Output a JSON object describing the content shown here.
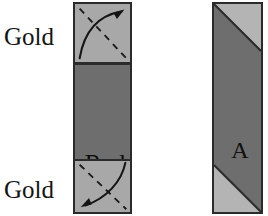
{
  "canvas": {
    "width": 268,
    "height": 216,
    "background": "#ffffff"
  },
  "figure": {
    "title": ""
  },
  "labels": {
    "gold_top": "Gold",
    "gold_bottom": "Gold",
    "red": "Red",
    "a": "A"
  },
  "left_strip": {
    "name": "layered-strip",
    "segments": [
      {
        "id": "gold-top",
        "label": "Gold",
        "fill": "#a8a8a8",
        "annotation": "curved-arrow-up-right-with-dashed-diagonal"
      },
      {
        "id": "red-middle",
        "label": "Red",
        "fill": "#6e6e6e",
        "annotation": "none"
      },
      {
        "id": "gold-bottom",
        "label": "Gold",
        "fill": "#a8a8a8",
        "annotation": "curved-arrow-down-left-with-dashed-diagonal"
      }
    ],
    "border_color": "#2b2b2b"
  },
  "right_strip": {
    "name": "diagonal-band-strip",
    "label": "A",
    "band_fill": "#6e6e6e",
    "corner_fill": "#b4b4b4",
    "border_color": "#2b2b2b"
  },
  "colors": {
    "gold": "#a8a8a8",
    "red": "#6e6e6e",
    "light_corner": "#b4b4b4",
    "outline": "#2b2b2b",
    "text": "#141414",
    "background": "#ffffff"
  }
}
